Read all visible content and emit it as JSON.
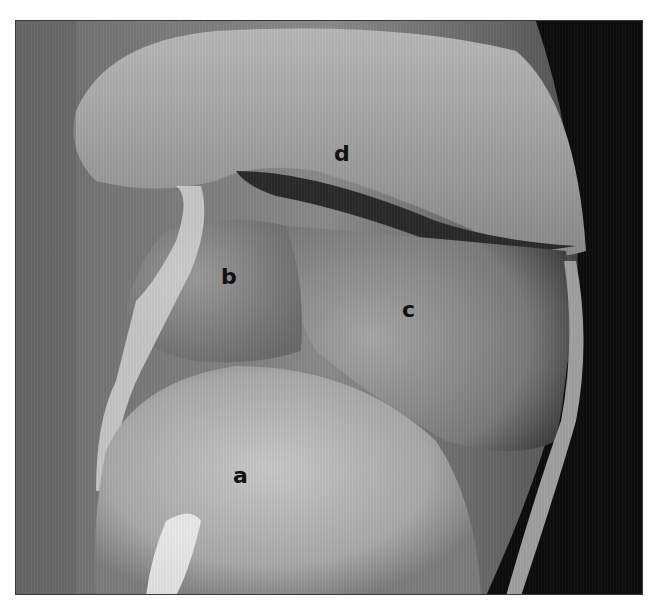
{
  "figure": {
    "labels": [
      {
        "id": "a",
        "text": "a",
        "x": 232,
        "y": 476
      },
      {
        "id": "b",
        "text": "b",
        "x": 220,
        "y": 277
      },
      {
        "id": "c",
        "text": "c",
        "x": 410,
        "y": 310
      },
      {
        "id": "d",
        "text": "d",
        "x": 340,
        "y": 152
      }
    ]
  }
}
